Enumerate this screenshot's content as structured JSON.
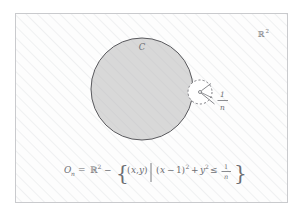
{
  "figure": {
    "title_alt": "Topology diagram: plane R^2 with closed disc C and removed small disc of radius 1/n",
    "frame": {
      "x": 15,
      "y": 13,
      "width": 273,
      "height": 190,
      "border_color": "#c9cacd",
      "fill_color": "#fdfdfd"
    },
    "hatching": {
      "color": "#e9eaec",
      "spacing": 8,
      "angle_deg": 45,
      "stroke_width": 1.1
    },
    "plane_label": {
      "text": "ℝ",
      "superscript": "2",
      "x": 258,
      "y": 36
    },
    "big_circle": {
      "label": "C",
      "label_x": 142,
      "label_y": 49,
      "cx": 142,
      "cy": 89,
      "r": 51,
      "fill": "#d6d6d6",
      "stroke": "#58585c",
      "stroke_width": 1.0
    },
    "small_circle": {
      "cx": 200,
      "cy": 92,
      "r": 12,
      "fill": "#ffffff",
      "stroke": "#6e6f73",
      "stroke_width": 0.9,
      "dash": "2.1 2.1",
      "center_dot_r": 1.4,
      "radius_line": {
        "x1": 200,
        "y1": 92,
        "x2": 211,
        "y2": 83
      },
      "leader_line": {
        "x1": 201,
        "y1": 93,
        "x2": 214,
        "y2": 104
      }
    },
    "radius_label": {
      "numerator": "1",
      "denominator": "n",
      "x": 222,
      "y_num": 96,
      "y_den": 110,
      "bar_x1": 217,
      "bar_x2": 228,
      "bar_y": 100
    },
    "equation": {
      "full_latex": "O_n = \\mathbb{R}^2 - \\left\\{ (x,y) \\,\\middle|\\, (x-1)^2 + y^2 \\le \\frac{1}{n} \\right\\}",
      "plain": "O_n = R^2 - { (x,y) | (x-1)^2 + y^2 <= 1/n }",
      "y_baseline": 173,
      "tokens": [
        {
          "text": "O",
          "x": 64,
          "style": "ital"
        },
        {
          "text": "n",
          "x": 71,
          "style": "sub"
        },
        {
          "text": "=",
          "x": 78,
          "style": "norm"
        },
        {
          "text": "ℝ",
          "x": 89,
          "style": "norm"
        },
        {
          "text": "2",
          "x": 96,
          "style": "sup"
        },
        {
          "text": "−",
          "x": 103,
          "style": "norm"
        },
        {
          "text": "(",
          "x": 126,
          "style": "norm"
        },
        {
          "text": "x",
          "x": 130,
          "style": "ital"
        },
        {
          "text": ",",
          "x": 135,
          "style": "norm"
        },
        {
          "text": "y",
          "x": 138,
          "style": "ital"
        },
        {
          "text": ")",
          "x": 143,
          "style": "norm"
        },
        {
          "text": "(",
          "x": 156,
          "style": "norm"
        },
        {
          "text": "x",
          "x": 160,
          "style": "ital"
        },
        {
          "text": "−",
          "x": 167,
          "style": "norm"
        },
        {
          "text": "1",
          "x": 176,
          "style": "norm"
        },
        {
          "text": ")",
          "x": 181,
          "style": "norm"
        },
        {
          "text": "2",
          "x": 185,
          "style": "sup"
        },
        {
          "text": "+",
          "x": 191,
          "style": "norm"
        },
        {
          "text": "y",
          "x": 200,
          "style": "ital"
        },
        {
          "text": "2",
          "x": 205,
          "style": "sup"
        },
        {
          "text": "≤",
          "x": 211,
          "style": "norm"
        },
        {
          "text": "1",
          "x": 225,
          "style": "norm"
        },
        {
          "text": "n",
          "x": 225,
          "style": "ital-den"
        }
      ],
      "braces": {
        "left_x": 118,
        "right_x": 234,
        "y": 173
      },
      "divider_bar": {
        "x": 149,
        "y1": 163,
        "y2": 182
      },
      "frac_bar": {
        "x1": 221,
        "x2": 231,
        "y": 172
      }
    },
    "colors": {
      "ink": "#6c6d72",
      "disc_fill": "#d6d6d6",
      "disc_stroke": "#58585c",
      "frame_border": "#c9cacd",
      "hatch": "#e9eaec",
      "page_background": "#ffffff"
    }
  }
}
